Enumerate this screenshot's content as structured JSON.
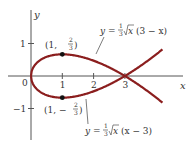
{
  "chart_data": {
    "type": "line",
    "title": "",
    "xlabel": "x",
    "ylabel": "y",
    "xlim": [
      0,
      4.2
    ],
    "x_ticks": [
      "1",
      "2",
      "3"
    ],
    "y_ticks": [
      "1",
      "-1"
    ],
    "origin_label": "0",
    "grid": false,
    "curve_color": "#8b1e1e",
    "series": [
      {
        "name": "upper",
        "equation": "y = (1/3)√x (3 − x)",
        "sign": 1
      },
      {
        "name": "lower",
        "equation": "y = (1/3)√x (x − 3)",
        "sign": -1
      }
    ],
    "points": [
      {
        "x": 1,
        "y": 0.6667,
        "label": "(1, 2/3)"
      },
      {
        "x": 1,
        "y": -0.6667,
        "label": "(1, −2/3)"
      }
    ],
    "annotations": {
      "upper_label": {
        "prefix": "y = ",
        "frac_num": "1",
        "frac_den": "3",
        "radicand": "x",
        "suffix": "(3 − x)"
      },
      "lower_label": {
        "prefix": "y = ",
        "frac_num": "1",
        "frac_den": "3",
        "radicand": "x",
        "suffix": "(x − 3)"
      },
      "point_top": {
        "open": "(1, ",
        "num": "2",
        "den": "3",
        "close": ")"
      },
      "point_bottom": {
        "open": "(1, −",
        "num": "2",
        "den": "3",
        "close": ")"
      }
    }
  }
}
